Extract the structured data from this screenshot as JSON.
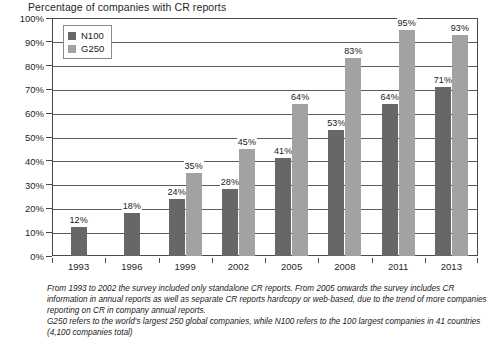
{
  "chart_data": {
    "type": "bar",
    "title": "Percentage of companies with CR reports",
    "xlabel": "",
    "ylabel": "",
    "ylim": [
      0,
      100
    ],
    "y_ticks": [
      "0%",
      "10%",
      "20%",
      "30%",
      "40%",
      "50%",
      "60%",
      "70%",
      "80%",
      "90%",
      "100%"
    ],
    "grid": true,
    "legend_position": "top-left-inside",
    "categories": [
      "1993",
      "1996",
      "1999",
      "2002",
      "2005",
      "2008",
      "2011",
      "2013"
    ],
    "series": [
      {
        "name": "N100",
        "color": "#676767",
        "values": [
          12,
          18,
          24,
          28,
          41,
          53,
          64,
          71
        ],
        "labels": [
          "12%",
          "18%",
          "24%",
          "28%",
          "41%",
          "53%",
          "64%",
          "71%"
        ]
      },
      {
        "name": "G250",
        "color": "#a2a2a2",
        "values": [
          null,
          null,
          35,
          45,
          64,
          83,
          95,
          93
        ],
        "labels": [
          "",
          "",
          "35%",
          "45%",
          "64%",
          "83%",
          "95%",
          "93%"
        ]
      }
    ],
    "annotations": [
      "From 1993 to 2002 the survey included only standalone CR reports. From 2005 onwards the survey includes CR information in annual reports as well as separate CR reports hardcopy or web-based, due to the trend of more companies reporting on CR in company annual reports.",
      "G250 refers to the world's largest 250 global companies, while N100 refers to the 100 largest companies in 41 countries (4,100 companies total)"
    ]
  },
  "legend": {
    "items": [
      {
        "label": "N100"
      },
      {
        "label": "G250"
      }
    ]
  },
  "footnote": {
    "paragraph1": "From 1993 to 2002 the survey included only standalone CR reports. From 2005 onwards the survey includes CR information in annual reports as well as separate CR reports hardcopy or web-based, due to the trend of more companies reporting on CR in company annual reports.",
    "paragraph2": "G250 refers to the world's largest 250 global companies, while N100 refers to the 100 largest companies in 41 countries (4,100 companies total)"
  }
}
